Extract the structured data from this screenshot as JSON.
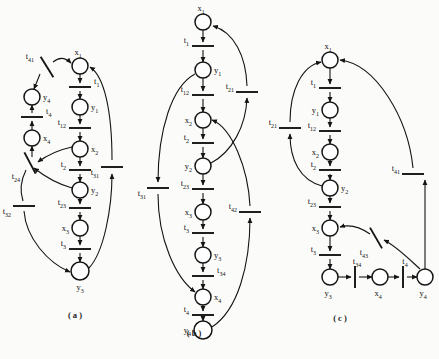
{
  "figure": {
    "captions": [
      {
        "id": "cap-a",
        "text": "( a )",
        "x": 75,
        "y": 318
      },
      {
        "id": "cap-b",
        "text": "( b )",
        "x": 194,
        "y": 336
      },
      {
        "id": "cap-c",
        "text": "( c )",
        "x": 340,
        "y": 321
      }
    ],
    "colors": {
      "stroke": "#141414",
      "fill": "#ffffff",
      "text": "#111111",
      "background": "#fbfbf9"
    }
  },
  "diagrams": [
    {
      "id": "a",
      "caption": "( a )",
      "places": [
        {
          "name": "x1",
          "label": "x",
          "subscript": "1",
          "cx": 80,
          "cy": 66,
          "r": 8,
          "label_dx": -2,
          "label_dy": -11,
          "anchor": "middle"
        },
        {
          "name": "y1",
          "label": "y",
          "subscript": "1",
          "cx": 80,
          "cy": 107,
          "r": 8,
          "label_dx": 11,
          "label_dy": 3,
          "anchor": "start"
        },
        {
          "name": "x2",
          "label": "x",
          "subscript": "2",
          "cx": 80,
          "cy": 149,
          "r": 8,
          "label_dx": 11,
          "label_dy": 3,
          "anchor": "start"
        },
        {
          "name": "y2",
          "label": "y",
          "subscript": "2",
          "cx": 80,
          "cy": 190,
          "r": 8,
          "label_dx": 11,
          "label_dy": 3,
          "anchor": "start"
        },
        {
          "name": "x3",
          "label": "x",
          "subscript": "3",
          "cx": 80,
          "cy": 228,
          "r": 8,
          "label_dx": -11,
          "label_dy": 3,
          "anchor": "end"
        },
        {
          "name": "y3",
          "label": "y",
          "subscript": "3",
          "cx": 80,
          "cy": 271,
          "r": 9,
          "label_dx": 0,
          "label_dy": 19,
          "anchor": "middle"
        },
        {
          "name": "y4",
          "label": "y",
          "subscript": "4",
          "cx": 32,
          "cy": 97,
          "r": 8,
          "label_dx": 11,
          "label_dy": 3,
          "anchor": "start"
        },
        {
          "name": "x4",
          "label": "x",
          "subscript": "4",
          "cx": 32,
          "cy": 138,
          "r": 8,
          "label_dx": 11,
          "label_dy": 3,
          "anchor": "start"
        }
      ],
      "transitions": [
        {
          "name": "t1",
          "label": "t",
          "subscript": "1",
          "x": 80,
          "y": 87,
          "len": 22,
          "angle": 0,
          "label_dx": 14,
          "label_dy": -3,
          "anchor": "start"
        },
        {
          "name": "t12",
          "label": "t",
          "subscript": "12",
          "x": 80,
          "y": 128,
          "len": 22,
          "angle": 0,
          "label_dx": -14,
          "label_dy": -3,
          "anchor": "end"
        },
        {
          "name": "t2",
          "label": "t",
          "subscript": "2",
          "x": 80,
          "y": 170,
          "len": 22,
          "angle": 0,
          "label_dx": -14,
          "label_dy": -3,
          "anchor": "end"
        },
        {
          "name": "t23",
          "label": "t",
          "subscript": "23",
          "x": 80,
          "y": 208,
          "len": 22,
          "angle": 0,
          "label_dx": -14,
          "label_dy": -3,
          "anchor": "end"
        },
        {
          "name": "t3",
          "label": "t",
          "subscript": "3",
          "x": 80,
          "y": 249,
          "len": 22,
          "angle": 0,
          "label_dx": -14,
          "label_dy": -3,
          "anchor": "end"
        },
        {
          "name": "t4",
          "label": "t",
          "subscript": "4",
          "x": 32,
          "y": 117,
          "len": 22,
          "angle": 0,
          "label_dx": 14,
          "label_dy": -3,
          "anchor": "start"
        },
        {
          "name": "t41",
          "label": "t",
          "subscript": "41",
          "x": 47,
          "y": 67,
          "len": 24,
          "angle": 58,
          "label_dx": -13,
          "label_dy": -8,
          "anchor": "end"
        },
        {
          "name": "t24",
          "label": "t",
          "subscript": "24",
          "x": 30,
          "y": 163,
          "len": 24,
          "angle": 62,
          "label_dx": -10,
          "label_dy": 16,
          "anchor": "end"
        },
        {
          "name": "t32",
          "label": "t",
          "subscript": "32",
          "x": 24,
          "y": 206,
          "len": 22,
          "angle": 0,
          "label_dx": -13,
          "label_dy": 8,
          "anchor": "end"
        },
        {
          "name": "t31",
          "label": "t",
          "subscript": "31",
          "x": 112,
          "y": 167,
          "len": 22,
          "angle": 0,
          "label_dx": -13,
          "label_dy": 8,
          "anchor": "end"
        }
      ]
    },
    {
      "id": "b",
      "caption": "( b )",
      "places": [
        {
          "name": "x1",
          "label": "x",
          "subscript": "1",
          "cx": 203,
          "cy": 22,
          "r": 8,
          "label_dx": -2,
          "label_dy": -11,
          "anchor": "middle"
        },
        {
          "name": "y1",
          "label": "y",
          "subscript": "1",
          "cx": 203,
          "cy": 70,
          "r": 8,
          "label_dx": 11,
          "label_dy": 3,
          "anchor": "start"
        },
        {
          "name": "x2",
          "label": "x",
          "subscript": "2",
          "cx": 203,
          "cy": 120,
          "r": 8,
          "label_dx": -11,
          "label_dy": 3,
          "anchor": "end"
        },
        {
          "name": "y2",
          "label": "y",
          "subscript": "2",
          "cx": 203,
          "cy": 166,
          "r": 8,
          "label_dx": -11,
          "label_dy": 3,
          "anchor": "end"
        },
        {
          "name": "x3",
          "label": "x",
          "subscript": "3",
          "cx": 203,
          "cy": 212,
          "r": 8,
          "label_dx": -11,
          "label_dy": 3,
          "anchor": "end"
        },
        {
          "name": "y3",
          "label": "y",
          "subscript": "3",
          "cx": 203,
          "cy": 255,
          "r": 8,
          "label_dx": 11,
          "label_dy": 3,
          "anchor": "start"
        },
        {
          "name": "x4",
          "label": "x",
          "subscript": "4",
          "cx": 203,
          "cy": 297,
          "r": 8,
          "label_dx": 11,
          "label_dy": 3,
          "anchor": "start"
        },
        {
          "name": "y4",
          "label": "y",
          "subscript": "4",
          "cx": 203,
          "cy": 330,
          "r": 9,
          "label_dx": -12,
          "label_dy": 3,
          "anchor": "end"
        }
      ],
      "transitions": [
        {
          "name": "t1",
          "label": "t",
          "subscript": "1",
          "x": 203,
          "y": 46,
          "len": 22,
          "angle": 0,
          "label_dx": -14,
          "label_dy": -3,
          "anchor": "end"
        },
        {
          "name": "t12",
          "label": "t",
          "subscript": "12",
          "x": 203,
          "y": 95,
          "len": 22,
          "angle": 0,
          "label_dx": -14,
          "label_dy": -3,
          "anchor": "end"
        },
        {
          "name": "t2",
          "label": "t",
          "subscript": "2",
          "x": 203,
          "y": 143,
          "len": 22,
          "angle": 0,
          "label_dx": -14,
          "label_dy": -3,
          "anchor": "end"
        },
        {
          "name": "t23",
          "label": "t",
          "subscript": "23",
          "x": 203,
          "y": 189,
          "len": 22,
          "angle": 0,
          "label_dx": -14,
          "label_dy": -3,
          "anchor": "end"
        },
        {
          "name": "t3",
          "label": "t",
          "subscript": "3",
          "x": 203,
          "y": 233,
          "len": 22,
          "angle": 0,
          "label_dx": -14,
          "label_dy": -3,
          "anchor": "end"
        },
        {
          "name": "t34",
          "label": "t",
          "subscript": "34",
          "x": 203,
          "y": 276,
          "len": 22,
          "angle": 0,
          "label_dx": 14,
          "label_dy": -3,
          "anchor": "start"
        },
        {
          "name": "t4",
          "label": "t",
          "subscript": "4",
          "x": 203,
          "y": 315,
          "len": 22,
          "angle": 0,
          "label_dx": -14,
          "label_dy": -3,
          "anchor": "end"
        },
        {
          "name": "t21",
          "label": "t",
          "subscript": "21",
          "x": 247,
          "y": 92,
          "len": 22,
          "angle": 0,
          "label_dx": -13,
          "label_dy": -3,
          "anchor": "end"
        },
        {
          "name": "t31",
          "label": "t",
          "subscript": "31",
          "x": 158,
          "y": 188,
          "len": 22,
          "angle": 0,
          "label_dx": -12,
          "label_dy": 8,
          "anchor": "end"
        },
        {
          "name": "t42",
          "label": "t",
          "subscript": "42",
          "x": 250,
          "y": 212,
          "len": 22,
          "angle": 0,
          "label_dx": -13,
          "label_dy": -3,
          "anchor": "end"
        }
      ]
    },
    {
      "id": "c",
      "caption": "( c )",
      "places": [
        {
          "name": "x1",
          "label": "x",
          "subscript": "1",
          "cx": 330,
          "cy": 60,
          "r": 8,
          "label_dx": -2,
          "label_dy": -11,
          "anchor": "middle"
        },
        {
          "name": "y1",
          "label": "y",
          "subscript": "1",
          "cx": 330,
          "cy": 110,
          "r": 8,
          "label_dx": -11,
          "label_dy": 3,
          "anchor": "end"
        },
        {
          "name": "x2",
          "label": "x",
          "subscript": "2",
          "cx": 330,
          "cy": 152,
          "r": 8,
          "label_dx": -11,
          "label_dy": 3,
          "anchor": "end"
        },
        {
          "name": "y2",
          "label": "y",
          "subscript": "2",
          "cx": 330,
          "cy": 188,
          "r": 8,
          "label_dx": 11,
          "label_dy": 3,
          "anchor": "start"
        },
        {
          "name": "x3",
          "label": "x",
          "subscript": "3",
          "cx": 330,
          "cy": 228,
          "r": 8,
          "label_dx": -11,
          "label_dy": 3,
          "anchor": "end"
        },
        {
          "name": "y3",
          "label": "y",
          "subscript": "3",
          "cx": 330,
          "cy": 277,
          "r": 8,
          "label_dx": -2,
          "label_dy": 19,
          "anchor": "middle"
        },
        {
          "name": "x4",
          "label": "x",
          "subscript": "4",
          "cx": 380,
          "cy": 277,
          "r": 8,
          "label_dx": -2,
          "label_dy": 19,
          "anchor": "middle"
        },
        {
          "name": "y4",
          "label": "y",
          "subscript": "4",
          "cx": 425,
          "cy": 277,
          "r": 8,
          "label_dx": -2,
          "label_dy": 19,
          "anchor": "middle"
        }
      ],
      "transitions": [
        {
          "name": "t1",
          "label": "t",
          "subscript": "1",
          "x": 330,
          "y": 88,
          "len": 22,
          "angle": 0,
          "label_dx": -14,
          "label_dy": -3,
          "anchor": "end"
        },
        {
          "name": "t12",
          "label": "t",
          "subscript": "12",
          "x": 330,
          "y": 131,
          "len": 22,
          "angle": 0,
          "label_dx": -14,
          "label_dy": -3,
          "anchor": "end"
        },
        {
          "name": "t2",
          "label": "t",
          "subscript": "2",
          "x": 330,
          "y": 170,
          "len": 22,
          "angle": 0,
          "label_dx": -14,
          "label_dy": -3,
          "anchor": "end"
        },
        {
          "name": "t23",
          "label": "t",
          "subscript": "23",
          "x": 330,
          "y": 207,
          "len": 22,
          "angle": 0,
          "label_dx": -14,
          "label_dy": -3,
          "anchor": "end"
        },
        {
          "name": "t3",
          "label": "t",
          "subscript": "3",
          "x": 330,
          "y": 255,
          "len": 22,
          "angle": 0,
          "label_dx": -14,
          "label_dy": -3,
          "anchor": "end"
        },
        {
          "name": "t34",
          "label": "t",
          "subscript": "34",
          "x": 355,
          "y": 277,
          "len": 22,
          "angle": 90,
          "label_dx": 2,
          "label_dy": -13,
          "anchor": "middle"
        },
        {
          "name": "t4",
          "label": "t",
          "subscript": "4",
          "x": 403,
          "y": 277,
          "len": 22,
          "angle": 90,
          "label_dx": 2,
          "label_dy": -13,
          "anchor": "middle"
        },
        {
          "name": "t21",
          "label": "t",
          "subscript": "21",
          "x": 290,
          "y": 128,
          "len": 22,
          "angle": 0,
          "label_dx": -13,
          "label_dy": -3,
          "anchor": "end"
        },
        {
          "name": "t41",
          "label": "t",
          "subscript": "41",
          "x": 413,
          "y": 174,
          "len": 22,
          "angle": 0,
          "label_dx": -13,
          "label_dy": -3,
          "anchor": "end"
        },
        {
          "name": "t43",
          "label": "t",
          "subscript": "43",
          "x": 376,
          "y": 238,
          "len": 24,
          "angle": 60,
          "label_dx": -8,
          "label_dy": 17,
          "anchor": "end"
        }
      ]
    }
  ]
}
